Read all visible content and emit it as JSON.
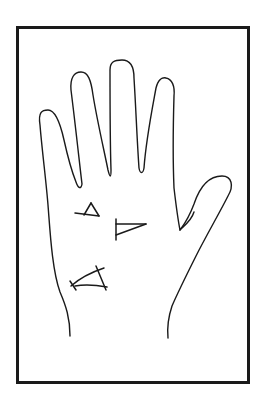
{
  "figure": {
    "colors": {
      "ink": "#1a1a1a",
      "background": "#ffffff"
    },
    "marks": [
      {
        "id": "mark-1",
        "shape": "cross-triangle",
        "location": "below index finger"
      },
      {
        "id": "mark-2",
        "shape": "triangle",
        "location": "center of palm"
      },
      {
        "id": "mark-3",
        "shape": "crossed-arc",
        "location": "lower palm near edge"
      }
    ]
  }
}
